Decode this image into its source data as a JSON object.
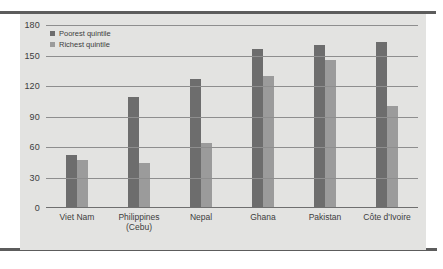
{
  "chart_data": {
    "type": "bar",
    "title": "",
    "subtitle": "",
    "xlabel": "",
    "ylabel": "",
    "categories": [
      "Viet Nam",
      "Philippines (Cebu)",
      "Nepal",
      "Ghana",
      "Pakistan",
      "Côte d'Ivoire"
    ],
    "category_lines": [
      [
        "Viet Nam"
      ],
      [
        "Philippines",
        "(Cebu)"
      ],
      [
        "Nepal"
      ],
      [
        "Ghana"
      ],
      [
        "Pakistan"
      ],
      [
        "Côte d'Ivoire"
      ]
    ],
    "series": [
      {
        "name": "Poorest quintile",
        "color": "#6d6d6d",
        "values": [
          52,
          109,
          127,
          156,
          160,
          163
        ]
      },
      {
        "name": "Richest quintile",
        "color": "#9b9b9b",
        "values": [
          47,
          44,
          64,
          130,
          146,
          100
        ]
      }
    ],
    "ylim": [
      0,
      180
    ],
    "yticks": [
      0,
      30,
      60,
      90,
      120,
      150,
      180
    ],
    "ytick_labels": [
      "0",
      "30",
      "60",
      "90",
      "120",
      "150",
      "180"
    ],
    "grid": true,
    "legend_position": "top-left",
    "legend": [
      "Poorest quintile",
      "Richest quintile"
    ]
  },
  "colors": {
    "panel_background": "#e3e3e1",
    "page_background": "#ffffff",
    "rule": "#5c5c5c",
    "gridline": "#8e8e8e",
    "text": "#3d3d3d",
    "poorest": "#6d6d6d",
    "richest": "#9b9b9b"
  }
}
